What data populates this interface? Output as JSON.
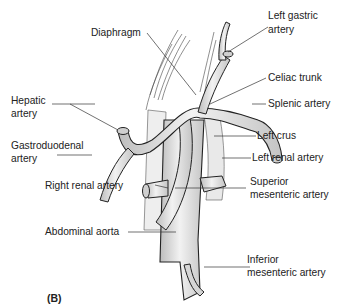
{
  "figure": {
    "panel_label": "(B)",
    "labels": {
      "diaphragm": "Diaphragm",
      "left_gastric_1": "Left gastric",
      "left_gastric_2": "artery",
      "celiac_trunk": "Celiac trunk",
      "hepatic_1": "Hepatic",
      "hepatic_2": "artery",
      "splenic": "Splenic artery",
      "left_crus": "Left crus",
      "gastroduodenal_1": "Gastroduodenal",
      "gastroduodenal_2": "artery",
      "left_renal": "Left renal artery",
      "right_renal": "Right renal artery",
      "superior_mesenteric_1": "Superior",
      "superior_mesenteric_2": "mesenteric artery",
      "abdominal_aorta": "Abdominal aorta",
      "inferior_mesenteric_1": "Inferior",
      "inferior_mesenteric_2": "mesenteric artery"
    },
    "colors": {
      "line": "#222222",
      "vessel_fill": "#e6e6e6",
      "vessel_shade": "#bdbdbd",
      "background": "#ffffff"
    }
  }
}
